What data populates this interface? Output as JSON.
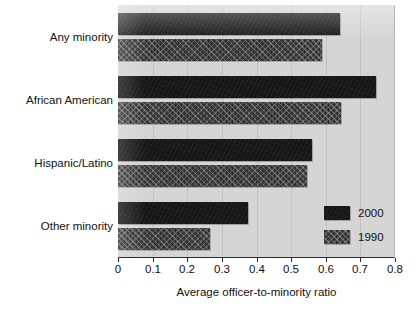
{
  "chart_data": {
    "type": "bar",
    "orientation": "horizontal",
    "title": "",
    "xlabel": "Average officer-to-minority ratio",
    "ylabel": "",
    "categories": [
      "Any minority",
      "African American",
      "Hispanic/Latino",
      "Other minority"
    ],
    "series": [
      {
        "name": "2000",
        "values": [
          0.64,
          0.745,
          0.56,
          0.375
        ],
        "color": "#151515",
        "fill": "solid"
      },
      {
        "name": "1990",
        "values": [
          0.59,
          0.645,
          0.545,
          0.265
        ],
        "color": "#3a3a3a",
        "fill": "hatched"
      }
    ],
    "xlim": [
      0,
      0.8
    ],
    "xticks": [
      0,
      0.1,
      0.2,
      0.3,
      0.4,
      0.5,
      0.6,
      0.7,
      0.8
    ],
    "xtick_labels": [
      "0",
      "0.1",
      "0.2",
      "0.3",
      "0.4",
      "0.5",
      "0.6",
      "0.7",
      "0.8"
    ],
    "grid": true,
    "grid_axis": "x",
    "legend_position": "bottom-right",
    "plot_background": "#d5d5d5",
    "page_background": "#ffffff"
  },
  "legend": {
    "entries": [
      {
        "label": "2000"
      },
      {
        "label": "1990"
      }
    ]
  }
}
